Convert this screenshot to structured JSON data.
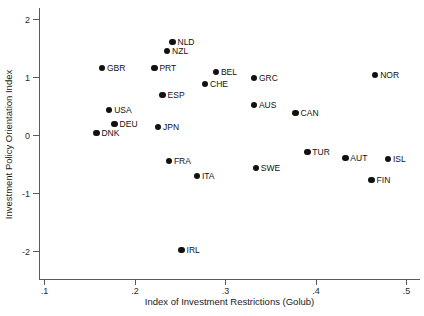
{
  "chart_data": {
    "type": "scatter",
    "title": "",
    "xlabel": "Index of Investment Restrictions (Golub)",
    "ylabel": "Investment Policy Orientation Index",
    "xlim": [
      0.085,
      0.51
    ],
    "ylim": [
      -2.35,
      2.2
    ],
    "xticks": [
      ".1",
      ".2",
      ".3",
      ".4",
      ".5"
    ],
    "xtick_values": [
      0.1,
      0.2,
      0.3,
      0.4,
      0.5
    ],
    "yticks": [
      "2",
      "1",
      "0",
      "-1",
      "-2"
    ],
    "ytick_values": [
      2,
      1,
      0,
      -1,
      -2
    ],
    "grid": false,
    "legend": "none",
    "marker_color": "#111111",
    "axis_color": "#5a5a5a",
    "background": "#ffffff",
    "points": [
      {
        "label": "NLD",
        "x": 0.242,
        "y": 1.6
      },
      {
        "label": "NZL",
        "x": 0.236,
        "y": 1.45
      },
      {
        "label": "GBR",
        "x": 0.164,
        "y": 1.16
      },
      {
        "label": "PRT",
        "x": 0.222,
        "y": 1.16
      },
      {
        "label": "BEL",
        "x": 0.29,
        "y": 1.09
      },
      {
        "label": "GRC",
        "x": 0.332,
        "y": 0.98
      },
      {
        "label": "NOR",
        "x": 0.466,
        "y": 1.03
      },
      {
        "label": "CHE",
        "x": 0.278,
        "y": 0.88
      },
      {
        "label": "ESP",
        "x": 0.231,
        "y": 0.69
      },
      {
        "label": "AUS",
        "x": 0.332,
        "y": 0.52
      },
      {
        "label": "USA",
        "x": 0.172,
        "y": 0.43
      },
      {
        "label": "CAN",
        "x": 0.378,
        "y": 0.38
      },
      {
        "label": "DEU",
        "x": 0.178,
        "y": 0.19
      },
      {
        "label": "JPN",
        "x": 0.226,
        "y": 0.14
      },
      {
        "label": "DNK",
        "x": 0.158,
        "y": 0.03
      },
      {
        "label": "TUR",
        "x": 0.391,
        "y": -0.29
      },
      {
        "label": "AUT",
        "x": 0.433,
        "y": -0.4
      },
      {
        "label": "ISL",
        "x": 0.48,
        "y": -0.41
      },
      {
        "label": "FRA",
        "x": 0.238,
        "y": -0.45
      },
      {
        "label": "SWE",
        "x": 0.334,
        "y": -0.57
      },
      {
        "label": "ITA",
        "x": 0.269,
        "y": -0.71
      },
      {
        "label": "FIN",
        "x": 0.462,
        "y": -0.78
      },
      {
        "label": "IRL",
        "x": 0.252,
        "y": -1.98
      }
    ]
  }
}
